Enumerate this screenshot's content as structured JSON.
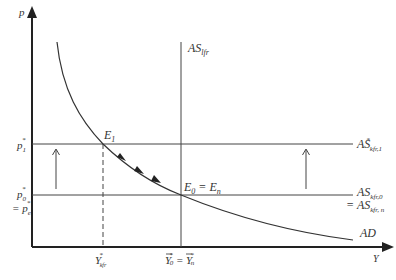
{
  "diagram": {
    "type": "AD-AS economics diagram",
    "axes": {
      "y_label": "p",
      "x_label": "Y"
    },
    "curves": {
      "as_lfr": {
        "label_main": "AS",
        "label_sub": "lfr"
      },
      "as_kfr_1": {
        "label_main": "AS",
        "label_sup": "*",
        "label_sub": "kfr,1"
      },
      "as_kfr_0": {
        "label_main": "AS",
        "label_sub": "kfr,0"
      },
      "as_kfr_n": {
        "label_prefix": "= ",
        "label_main": "AS",
        "label_sub": "kfr, n"
      },
      "ad": {
        "label": "AD"
      }
    },
    "points": {
      "e1": {
        "label_main": "E",
        "label_sub": "1"
      },
      "e0": {
        "label_main": "E",
        "label_sub": "0",
        "label_eq": " = E",
        "label_sub2": "n"
      }
    },
    "price_ticks": {
      "p1": {
        "main": "p",
        "sub": "1",
        "sup": "*"
      },
      "p0": {
        "main": "p",
        "sub": "0",
        "sup": "*"
      },
      "pe": {
        "prefix": "= ",
        "main": "p",
        "sub": "e",
        "sup": "*"
      }
    },
    "output_ticks": {
      "y_kfr": {
        "main": "Y",
        "sub": "kfr",
        "sup": "*"
      },
      "y0": {
        "main": "Y",
        "sub": "0",
        "sup": "*",
        "eq": " = ",
        "main2": "Y",
        "sub2": "n",
        "sup2": "*"
      }
    },
    "colors": {
      "line": "#333333",
      "axis": "#222222",
      "background": "#ffffff"
    }
  }
}
